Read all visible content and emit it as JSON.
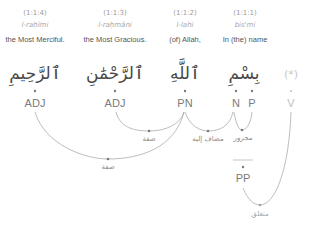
{
  "words": [
    {
      "loc": "(1:1:4)",
      "translit": "l-raḥīmi",
      "gloss": "the Most Merciful.",
      "arabic": "ٱلرَّحِيمِ",
      "x": 35
    },
    {
      "loc": "(1:1:3)",
      "translit": "l-raḥmāni",
      "gloss": "the Most Gracious.",
      "arabic": "ٱلرَّحْمَٰنِ",
      "x": 115
    },
    {
      "loc": "(1:1:2)",
      "translit": "l-lahi",
      "gloss": "(of) Allah,",
      "arabic": "ٱللَّهِ",
      "x": 185
    },
    {
      "loc": "(1:1:1)",
      "translit": "bis'mi",
      "gloss": "In (the) name",
      "arabic": "بِسْمِ",
      "x": 245
    }
  ],
  "hidden_word": {
    "arabic": "(*)",
    "tag": "V"
  },
  "tags": [
    {
      "label": "ADJ"
    },
    {
      "label": "ADJ"
    },
    {
      "label": "PN"
    },
    {
      "label": "N"
    },
    {
      "label": "P"
    }
  ],
  "phrase_node": {
    "label": "PP"
  },
  "relations": [
    {
      "label": "صفة",
      "from": "ADJ (1:1:3)",
      "to": "PN"
    },
    {
      "label": "مضاف إليه",
      "from": "PN",
      "to": "N"
    },
    {
      "label": "مجرور",
      "from": "N",
      "to": "P"
    },
    {
      "label": "صفة",
      "from": "ADJ (1:1:4)",
      "to": "PN"
    },
    {
      "label": "متعلق",
      "from": "PP",
      "to": "V"
    }
  ],
  "colors": {
    "arc": "#9a9a9a",
    "dot": "#777777",
    "text_dark": "#555555",
    "text_light": "#a8a8a8"
  }
}
